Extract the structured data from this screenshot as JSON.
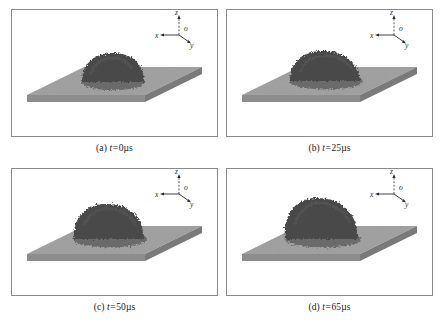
{
  "figure": {
    "layout": {
      "rows": 2,
      "cols": 2
    },
    "colors": {
      "panel_border": "#8a8a8a",
      "panel_background": "#ffffff",
      "slab_top": "#9e9e9e",
      "slab_front": "#8a8a8a",
      "slab_side": "#787878",
      "droplet": "#4a4a4a",
      "droplet_shadow": "#3c3c3c",
      "axis_line": "#2b2b2b",
      "caption_text": "#1a1a1a"
    },
    "axis_triad": {
      "name": "coordinate-axes",
      "origin_label": "o",
      "x_label": "x",
      "y_label": "y",
      "z_label": "z"
    },
    "panels": [
      {
        "id": "a",
        "tag": "(a)",
        "variable": "t",
        "equals": "=",
        "value": "0",
        "unit": "µs",
        "caption": "(a) t = 0µs",
        "droplet_state": "dome, near-hemispherical, smallest footprint",
        "droplet_width": 62,
        "droplet_height": 28
      },
      {
        "id": "b",
        "tag": "(b)",
        "variable": "t",
        "equals": "=",
        "value": "25",
        "unit": "µs",
        "caption": "(b) t = 25µs",
        "droplet_state": "flattened dome, wider footprint, spreading",
        "droplet_width": 72,
        "droplet_height": 30
      },
      {
        "id": "c",
        "tag": "(c)",
        "variable": "t",
        "equals": "=",
        "value": "50",
        "unit": "µs",
        "caption": "(c) t = 50µs",
        "droplet_state": "taller irregular mound, rough crest",
        "droplet_width": 74,
        "droplet_height": 36
      },
      {
        "id": "d",
        "tag": "(d)",
        "variable": "t",
        "equals": "=",
        "value": "65",
        "unit": "µs",
        "caption": "(d) t = 65µs",
        "droplet_state": "tallest asymmetric mound leaning left, ragged surface",
        "droplet_width": 76,
        "droplet_height": 42
      }
    ]
  }
}
